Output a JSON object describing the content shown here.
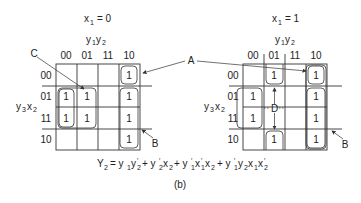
{
  "figure": {
    "caption": "(b)",
    "equation": {
      "lhs": "Y",
      "lhs_sub": "2",
      "rhs": "y1 y2' + y2' x2 + y1' x1' x2 + y1' y2 x1 x2'"
    },
    "callouts": {
      "A": "A",
      "B": "B",
      "C": "C",
      "D": "D"
    },
    "maps": [
      {
        "title_var": "x",
        "title_sub": "1",
        "title_value": "= 0",
        "col_var_label": "y1 y2",
        "row_var_label": "y3 x2",
        "col_labels": [
          "00",
          "01",
          "11",
          "10"
        ],
        "row_labels": [
          "00",
          "01",
          "11",
          "10"
        ],
        "cells": [
          [
            "",
            "",
            "",
            "1"
          ],
          [
            "1",
            "1",
            "",
            "1"
          ],
          [
            "1",
            "1",
            "",
            "1"
          ],
          [
            "",
            "",
            "",
            "1"
          ]
        ]
      },
      {
        "title_var": "x",
        "title_sub": "1",
        "title_value": "= 1",
        "col_var_label": "y1 y2",
        "row_var_label": "y3 x2",
        "col_labels": [
          "00",
          "01",
          "11",
          "10"
        ],
        "row_labels": [
          "00",
          "01",
          "11",
          "10"
        ],
        "cells": [
          [
            "",
            "1",
            "",
            "1"
          ],
          [
            "1",
            "",
            "",
            "1"
          ],
          [
            "1",
            "",
            "",
            "1"
          ],
          [
            "",
            "1",
            "",
            "1"
          ]
        ]
      }
    ]
  }
}
